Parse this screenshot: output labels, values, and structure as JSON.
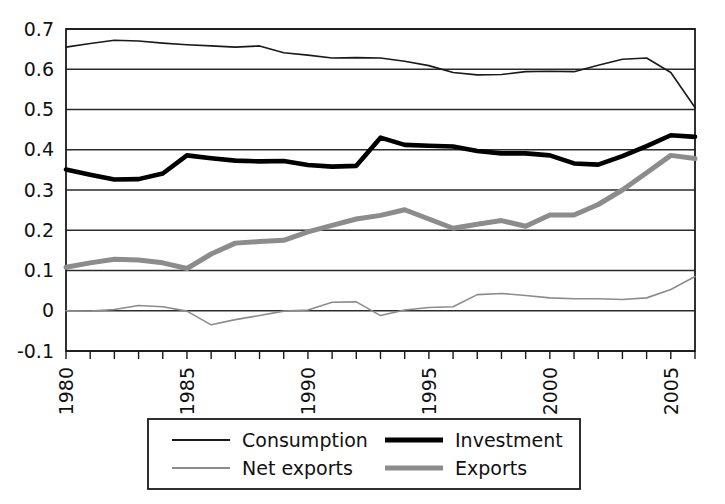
{
  "chart_data": {
    "type": "line",
    "title": "",
    "subtitle": "",
    "xlabel": "",
    "ylabel": "",
    "xlim": [
      1980,
      2006
    ],
    "ylim": [
      -0.1,
      0.7
    ],
    "grid": "horizontal",
    "legend_position": "bottom",
    "x": [
      1980,
      1981,
      1982,
      1983,
      1984,
      1985,
      1986,
      1987,
      1988,
      1989,
      1990,
      1991,
      1992,
      1993,
      1994,
      1995,
      1996,
      1997,
      1998,
      1999,
      2000,
      2001,
      2002,
      2003,
      2004,
      2005,
      2006
    ],
    "x_tick_labels": [
      "1980",
      "1985",
      "1990",
      "1995",
      "2000",
      "2005"
    ],
    "x_tick_values": [
      1980,
      1985,
      1990,
      1995,
      2000,
      2005
    ],
    "y_tick_labels": [
      "0.7",
      "0.6",
      "0.5",
      "0.4",
      "0.3",
      "0.2",
      "0.1",
      "0",
      "-0.1"
    ],
    "y_tick_values": [
      0.7,
      0.6,
      0.5,
      0.4,
      0.3,
      0.2,
      0.1,
      0,
      -0.1
    ],
    "series": [
      {
        "name": "Consumption",
        "color": "#1a1a1a",
        "width": 1.6,
        "values": [
          0.655,
          0.664,
          0.672,
          0.67,
          0.665,
          0.661,
          0.658,
          0.655,
          0.658,
          0.641,
          0.635,
          0.628,
          0.629,
          0.628,
          0.62,
          0.609,
          0.592,
          0.586,
          0.587,
          0.594,
          0.595,
          0.594,
          0.61,
          0.625,
          0.628,
          0.592,
          0.505
        ]
      },
      {
        "name": "Investment",
        "color": "#000000",
        "width": 4.6,
        "values": [
          0.351,
          0.338,
          0.326,
          0.327,
          0.341,
          0.386,
          0.379,
          0.373,
          0.371,
          0.372,
          0.362,
          0.358,
          0.36,
          0.43,
          0.412,
          0.41,
          0.408,
          0.397,
          0.391,
          0.391,
          0.386,
          0.366,
          0.363,
          0.384,
          0.409,
          0.436,
          0.432
        ]
      },
      {
        "name": "Net exports",
        "color": "#8c8c8c",
        "width": 1.6,
        "values": [
          0.0,
          -0.001,
          0.003,
          0.013,
          0.01,
          -0.001,
          -0.035,
          -0.022,
          -0.012,
          -0.001,
          0.002,
          0.021,
          0.022,
          -0.012,
          0.002,
          0.008,
          0.01,
          0.04,
          0.043,
          0.038,
          0.032,
          0.03,
          0.03,
          0.028,
          0.032,
          0.053,
          0.085
        ]
      },
      {
        "name": "Exports",
        "color": "#8c8c8c",
        "width": 5.0,
        "values": [
          0.108,
          0.119,
          0.128,
          0.126,
          0.119,
          0.105,
          0.141,
          0.168,
          0.172,
          0.175,
          0.196,
          0.212,
          0.228,
          0.237,
          0.251,
          0.228,
          0.205,
          0.215,
          0.224,
          0.21,
          0.238,
          0.238,
          0.264,
          0.3,
          0.343,
          0.386,
          0.378
        ]
      }
    ]
  },
  "legend": {
    "entries": [
      {
        "label": "Consumption",
        "color": "#1a1a1a",
        "width": 1.8
      },
      {
        "label": "Investment",
        "color": "#000000",
        "width": 5.0
      },
      {
        "label": "Net exports",
        "color": "#8c8c8c",
        "width": 1.8
      },
      {
        "label": "Exports",
        "color": "#8c8c8c",
        "width": 5.0
      }
    ]
  }
}
